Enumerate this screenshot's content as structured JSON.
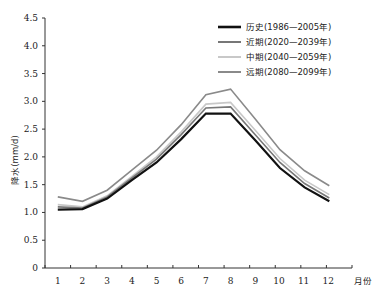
{
  "chart_data": {
    "type": "line",
    "title": "",
    "xlabel": "月份",
    "ylabel": "降水(mm/d)",
    "categories": [
      "1",
      "2",
      "3",
      "4",
      "5",
      "6",
      "7",
      "8",
      "9",
      "10",
      "11",
      "12"
    ],
    "ylim": [
      0,
      4.5
    ],
    "yticks": [
      "0",
      "0.5",
      "1.0",
      "1.5",
      "2.0",
      "2.5",
      "3.0",
      "3.5",
      "4.0",
      "4.5"
    ],
    "grid": false,
    "legend_position": "upper right",
    "series": [
      {
        "name": "历史(1986—2005年)",
        "color": "#111111",
        "width": 2.2,
        "values": [
          1.05,
          1.06,
          1.25,
          1.58,
          1.9,
          2.32,
          2.78,
          2.78,
          2.3,
          1.8,
          1.45,
          1.2
        ]
      },
      {
        "name": "近期(2020—2039年)",
        "color": "#777777",
        "width": 1.6,
        "values": [
          1.1,
          1.08,
          1.28,
          1.62,
          1.96,
          2.4,
          2.88,
          2.9,
          2.4,
          1.9,
          1.52,
          1.26
        ]
      },
      {
        "name": "中期(2040—2059年)",
        "color": "#c8c8c8",
        "width": 1.6,
        "values": [
          1.14,
          1.1,
          1.3,
          1.65,
          2.0,
          2.45,
          2.95,
          2.98,
          2.48,
          1.97,
          1.58,
          1.32
        ]
      },
      {
        "name": "远期(2080—2099年)",
        "color": "#8a8a8a",
        "width": 1.6,
        "values": [
          1.28,
          1.2,
          1.4,
          1.76,
          2.12,
          2.58,
          3.12,
          3.22,
          2.68,
          2.13,
          1.75,
          1.48
        ]
      }
    ]
  }
}
